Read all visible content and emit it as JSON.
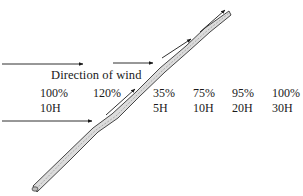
{
  "diagram": {
    "title": "Direction of wind",
    "columns": [
      {
        "percent": "100%",
        "height": "10H",
        "x": 40
      },
      {
        "percent": "120%",
        "height": "",
        "x": 93
      },
      {
        "percent": "35%",
        "height": "5H",
        "x": 153
      },
      {
        "percent": "75%",
        "height": "10H",
        "x": 193
      },
      {
        "percent": "95%",
        "height": "20H",
        "x": 232
      },
      {
        "percent": "100%",
        "height": "30H",
        "x": 272
      }
    ],
    "arrows": [
      {
        "name": "wind-arrow-left-upper",
        "x1": 2,
        "y1": 64,
        "x2": 83,
        "y2": 64
      },
      {
        "name": "wind-arrow-middle-upper",
        "x1": 113,
        "y1": 63,
        "x2": 153,
        "y2": 63
      },
      {
        "name": "wind-arrow-left-lower",
        "x1": 2,
        "y1": 121,
        "x2": 92,
        "y2": 121
      },
      {
        "name": "deflected-arrow-1",
        "x1": 106,
        "y1": 115,
        "x2": 135,
        "y2": 89
      },
      {
        "name": "deflected-arrow-2",
        "x1": 162,
        "y1": 58,
        "x2": 191,
        "y2": 39
      },
      {
        "name": "deflected-arrow-3",
        "x1": 200,
        "y1": 32,
        "x2": 225,
        "y2": 10
      }
    ],
    "windbreak": {
      "x1": 36,
      "y1": 189,
      "x2": 229,
      "y2": 14
    },
    "colors": {
      "ink": "#1a1a1a",
      "windbreak_fill": "#d8d8d8"
    }
  }
}
